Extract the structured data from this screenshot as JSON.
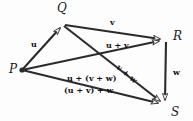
{
  "figure": {
    "kind": "vector-addition-associativity-diagram",
    "width": 193,
    "height": 121,
    "background_color": "#fdfdfd",
    "stroke_color": "#2b2b2b",
    "label_color": "#111111"
  },
  "vertices": [
    {
      "id": "P",
      "label": "P",
      "x": 22,
      "y": 70,
      "label_x": 9,
      "label_y": 63,
      "has_dot": true
    },
    {
      "id": "Q",
      "label": "Q",
      "x": 63,
      "y": 24,
      "label_x": 57,
      "label_y": 2,
      "has_dot": false
    },
    {
      "id": "R",
      "label": "R",
      "x": 166,
      "y": 40,
      "label_x": 173,
      "label_y": 30,
      "has_dot": false
    },
    {
      "id": "S",
      "label": "S",
      "x": 164,
      "y": 106,
      "label_x": 171,
      "label_y": 106,
      "has_dot": false
    }
  ],
  "vectors": [
    {
      "id": "u",
      "from": "P",
      "to": "Q",
      "label": "u",
      "label_x": 31,
      "label_y": 40,
      "rotate": 0
    },
    {
      "id": "v",
      "from": "Q",
      "to": "R",
      "label": "v",
      "label_x": 110,
      "label_y": 18,
      "rotate": 0
    },
    {
      "id": "w",
      "from": "R",
      "to": "S",
      "label": "w",
      "label_x": 173,
      "label_y": 68,
      "rotate": 0
    },
    {
      "id": "u+v",
      "from": "P",
      "to": "R",
      "label": "u + v",
      "label_x": 106,
      "label_y": 41,
      "rotate": 0
    },
    {
      "id": "v+w",
      "from": "Q",
      "to": "S",
      "label": "v + w",
      "label_x": 118,
      "label_y": 62,
      "rotate": 40
    },
    {
      "id": "sum-top",
      "from": "P",
      "to": "S",
      "label": "u + (v + w)",
      "label_x": 67,
      "label_y": 74,
      "rotate": 0
    },
    {
      "id": "sum-bot",
      "from": "P",
      "to": "S",
      "label": "(u + v) + w",
      "label_x": 64,
      "label_y": 86,
      "rotate": 0
    }
  ]
}
